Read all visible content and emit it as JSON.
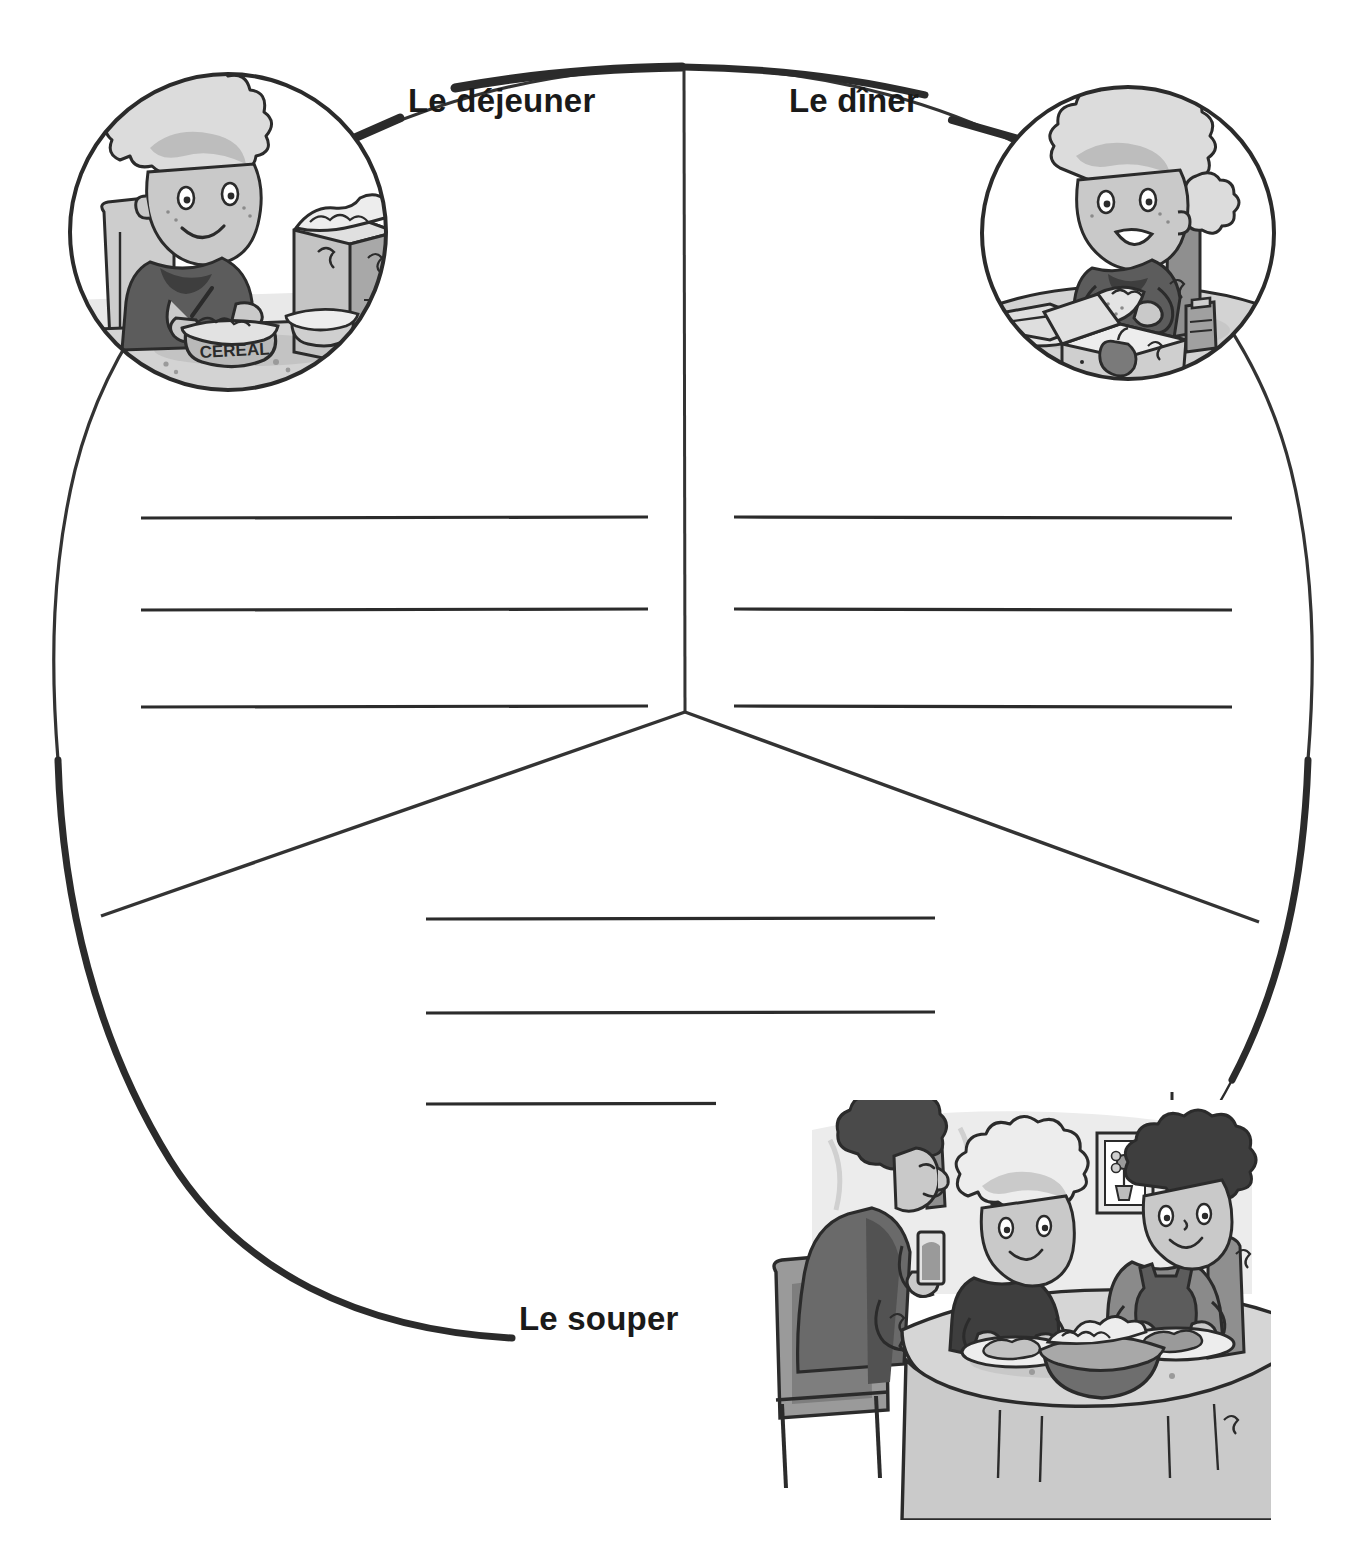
{
  "worksheet": {
    "title_fragment": "Les repas",
    "background_color": "#ffffff",
    "ink_color": "#2b2b2b"
  },
  "sections": [
    {
      "id": "dejeuner",
      "label": "Le déjeuner",
      "label_position": "top-left",
      "writing_lines": 3,
      "illustration": {
        "name": "breakfast-cereal-illustration",
        "shape": "circle",
        "description": "Child seated at a table eating from a bowl labelled CEREAL beside an open cereal box",
        "bowl_text": "CEREAL"
      }
    },
    {
      "id": "diner",
      "label": "Le dîner",
      "label_position": "top-right",
      "writing_lines": 3,
      "illustration": {
        "name": "lunch-sandwich-illustration",
        "shape": "circle",
        "description": "Child eating a sandwich at a table with an open lunch box containing an apple",
        "bowl_text": ""
      }
    },
    {
      "id": "souper",
      "label": "Le souper",
      "label_position": "bottom-left",
      "writing_lines": 3,
      "illustration": {
        "name": "supper-family-dinner-illustration",
        "shape": "rectangle",
        "description": "Three family members seated around a round table sharing a meal, framed picture of a flower on the wall",
        "bowl_text": ""
      }
    }
  ],
  "colors": {
    "ink": "#2b2b2b",
    "line": "#333333",
    "skin": "#c9c9c9",
    "hair_light": "#d8d8d8",
    "hair_dark": "#4a4a4a",
    "shirt_dark": "#5c5c5c",
    "shirt_mid": "#8a8a8a",
    "shade_light": "#e4e4e4",
    "shade_mid": "#b4b4b4",
    "bowl_dark": "#6e6e6e"
  }
}
